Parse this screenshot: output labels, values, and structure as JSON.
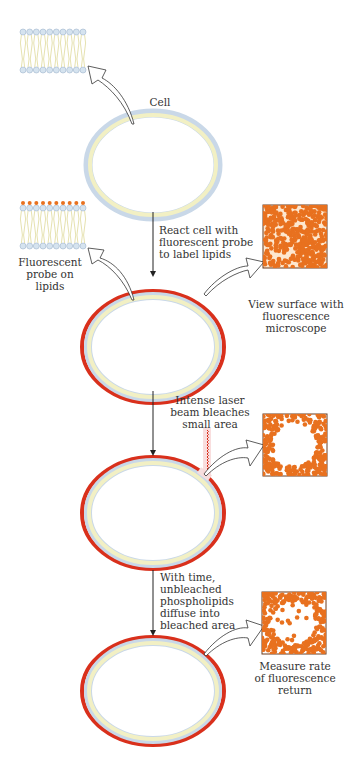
{
  "diagram": {
    "colors": {
      "membrane_outer": "#c9d8e8",
      "membrane_inner": "#f2f0c4",
      "fluorescent_ring": "#d9301c",
      "fluor_dot": "#e8711f",
      "head_group": "#d5e3ef",
      "tail": "#e6e2b0",
      "laser": "#d9301c",
      "arrow": "#222222"
    },
    "stages": [
      {
        "id": "cell",
        "label_lines": [
          "Cell"
        ],
        "bilayer_label_lines": []
      },
      {
        "id": "labeled",
        "step_text_lines": [
          "React cell with",
          "fluorescent probe",
          "to label lipids"
        ],
        "bilayer_label_lines": [
          "Fluorescent",
          "probe on",
          "lipids"
        ],
        "inset_label_lines": [
          "View surface with",
          "fluorescence",
          "microscope"
        ],
        "inset_state": "uniform"
      },
      {
        "id": "bleached",
        "step_text_lines": [
          "Intense laser",
          "beam bleaches",
          "small area"
        ],
        "inset_state": "bleached"
      },
      {
        "id": "recovery",
        "step_text_lines": [
          "With time,",
          "unbleached",
          "phospholipids",
          "diffuse into",
          "bleached area"
        ],
        "inset_label_lines": [
          "Measure rate",
          "of fluorescence",
          "return"
        ],
        "inset_state": "recovering"
      }
    ]
  }
}
